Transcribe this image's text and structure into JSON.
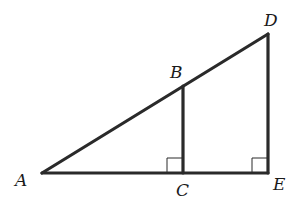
{
  "diagram": {
    "type": "geometry",
    "points": {
      "A": {
        "label": "A",
        "x": 42,
        "y": 173
      },
      "B": {
        "label": "B",
        "x": 183,
        "y": 86
      },
      "C": {
        "label": "C",
        "x": 183,
        "y": 173
      },
      "D": {
        "label": "D",
        "x": 268,
        "y": 34
      },
      "E": {
        "label": "E",
        "x": 268,
        "y": 173
      }
    },
    "segments": [
      [
        "A",
        "D"
      ],
      [
        "A",
        "E"
      ],
      [
        "B",
        "C"
      ],
      [
        "D",
        "E"
      ]
    ],
    "right_angles": [
      "C",
      "E"
    ],
    "stroke_color": "#2a2a2a"
  }
}
